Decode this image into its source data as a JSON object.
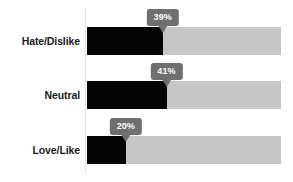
{
  "chart_data": {
    "type": "bar",
    "orientation": "horizontal",
    "title": "",
    "subtitle": "",
    "xlabel": "",
    "ylabel": "",
    "grid": false,
    "legend": null,
    "axis_line": true,
    "xlim": [
      0,
      100
    ],
    "value_suffix": "%",
    "categories": [
      "Hate/Dislike",
      "Neutral",
      "Love/Like"
    ],
    "values": [
      39,
      41,
      20
    ],
    "data_labels": [
      "39%",
      "41%",
      "20%"
    ],
    "colors": {
      "fill": "#050505",
      "track": "#c6c6c6",
      "callout_bg": "#6f6f6f",
      "callout_text": "#ffffff",
      "label_text": "#1b1b1b",
      "axis": "#e4e4e4",
      "background": "#ffffff"
    },
    "bars": [
      {
        "category": "Hate/Dislike",
        "value": 39,
        "label": "39%"
      },
      {
        "category": "Neutral",
        "value": 41,
        "label": "41%"
      },
      {
        "category": "Love/Like",
        "value": 20,
        "label": "20%"
      }
    ]
  }
}
